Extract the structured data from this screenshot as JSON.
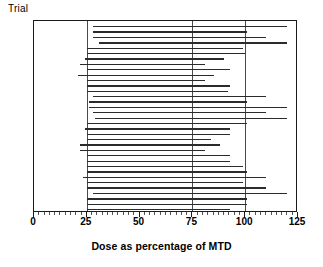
{
  "chart_data": {
    "type": "bar",
    "title": "",
    "subtitle": "",
    "xlabel": "Dose as percentage of MTD",
    "ylabel": "Trial",
    "xlim": [
      0,
      125
    ],
    "ylim": [
      0,
      34
    ],
    "grid": true,
    "gridlines_x": [
      25,
      75,
      100
    ],
    "xticks": [
      0,
      25,
      50,
      75,
      100,
      125
    ],
    "xticklabels": [
      "0",
      "25",
      "50",
      "75",
      "100",
      "125"
    ],
    "yticks": [],
    "yticklabels": [],
    "legend": null,
    "legend_position": "none",
    "orientation": "horizontal",
    "series_note": "Each row is one trial; the horizontal line spans the lowest to the highest dose administered, expressed as a percentage of the MTD.",
    "categories": [
      "Trial 1",
      "Trial 2",
      "Trial 3",
      "Trial 4",
      "Trial 5",
      "Trial 6",
      "Trial 7",
      "Trial 8",
      "Trial 9",
      "Trial 10",
      "Trial 11",
      "Trial 12",
      "Trial 13",
      "Trial 14",
      "Trial 15",
      "Trial 16",
      "Trial 17",
      "Trial 18",
      "Trial 19",
      "Trial 20",
      "Trial 21",
      "Trial 22",
      "Trial 23",
      "Trial 24",
      "Trial 25",
      "Trial 26",
      "Trial 27",
      "Trial 28",
      "Trial 29",
      "Trial 30",
      "Trial 31",
      "Trial 32",
      "Trial 33",
      "Trial 34"
    ],
    "ranges": [
      {
        "trial": "Trial 1",
        "start": 28,
        "end": 120
      },
      {
        "trial": "Trial 2",
        "start": 28,
        "end": 101
      },
      {
        "trial": "Trial 3",
        "start": 28,
        "end": 110
      },
      {
        "trial": "Trial 4",
        "start": 31,
        "end": 120
      },
      {
        "trial": "Trial 5",
        "start": 25,
        "end": 99
      },
      {
        "trial": "Trial 6",
        "start": 25,
        "end": 100
      },
      {
        "trial": "Trial 7",
        "start": 24,
        "end": 90
      },
      {
        "trial": "Trial 8",
        "start": 22,
        "end": 81
      },
      {
        "trial": "Trial 9",
        "start": 25,
        "end": 93
      },
      {
        "trial": "Trial 10",
        "start": 21,
        "end": 85
      },
      {
        "trial": "Trial 11",
        "start": 25,
        "end": 81
      },
      {
        "trial": "Trial 12",
        "start": 25,
        "end": 93
      },
      {
        "trial": "Trial 13",
        "start": 25,
        "end": 92
      },
      {
        "trial": "Trial 14",
        "start": 28,
        "end": 110
      },
      {
        "trial": "Trial 15",
        "start": 26,
        "end": 101
      },
      {
        "trial": "Trial 16",
        "start": 26,
        "end": 120
      },
      {
        "trial": "Trial 17",
        "start": 28,
        "end": 110
      },
      {
        "trial": "Trial 18",
        "start": 29,
        "end": 120
      },
      {
        "trial": "Trial 19",
        "start": 25,
        "end": 101
      },
      {
        "trial": "Trial 20",
        "start": 24,
        "end": 93
      },
      {
        "trial": "Trial 21",
        "start": 25,
        "end": 93
      },
      {
        "trial": "Trial 22",
        "start": 25,
        "end": 84
      },
      {
        "trial": "Trial 23",
        "start": 22,
        "end": 88
      },
      {
        "trial": "Trial 24",
        "start": 22,
        "end": 81
      },
      {
        "trial": "Trial 25",
        "start": 25,
        "end": 93
      },
      {
        "trial": "Trial 26",
        "start": 25,
        "end": 93
      },
      {
        "trial": "Trial 27",
        "start": 25,
        "end": 99
      },
      {
        "trial": "Trial 28",
        "start": 25,
        "end": 101
      },
      {
        "trial": "Trial 29",
        "start": 23,
        "end": 110
      },
      {
        "trial": "Trial 30",
        "start": 25,
        "end": 99
      },
      {
        "trial": "Trial 31",
        "start": 25,
        "end": 110
      },
      {
        "trial": "Trial 32",
        "start": 28,
        "end": 120
      },
      {
        "trial": "Trial 33",
        "start": 25,
        "end": 101
      },
      {
        "trial": "Trial 34",
        "start": 25,
        "end": 101
      },
      {
        "trial": "Trial 35",
        "start": 25,
        "end": 93
      }
    ]
  }
}
